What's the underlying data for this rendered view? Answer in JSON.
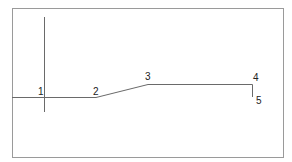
{
  "diagram": {
    "frame": {
      "x": 12,
      "y": 8,
      "width": 271,
      "height": 149,
      "stroke": "#9a9a9a"
    },
    "line_color": "#6a6a6a",
    "axis_line": {
      "x": 44,
      "y1": 17,
      "y2": 112
    },
    "polyline": [
      {
        "x": 12,
        "y": 97
      },
      {
        "x": 96,
        "y": 97
      },
      {
        "x": 148,
        "y": 84
      },
      {
        "x": 252,
        "y": 84
      },
      {
        "x": 252,
        "y": 97
      }
    ],
    "labels": [
      {
        "text": "1",
        "x": 38,
        "y": 95
      },
      {
        "text": "2",
        "x": 93,
        "y": 95
      },
      {
        "text": "3",
        "x": 145,
        "y": 80
      },
      {
        "text": "4",
        "x": 253,
        "y": 81
      },
      {
        "text": "5",
        "x": 256,
        "y": 104
      }
    ]
  }
}
